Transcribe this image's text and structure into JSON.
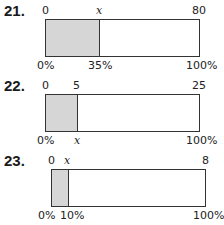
{
  "problems": [
    {
      "number": "21.",
      "top_labels": {
        "start": "0",
        "part": "x",
        "whole": "80"
      },
      "bottom_labels": {
        "start": "0%",
        "part": "35%",
        "whole": "100%"
      },
      "filled_fraction": 0.35,
      "fill_color": "#d6d6d6"
    },
    {
      "number": "22.",
      "top_labels": {
        "start": "0",
        "part": "5",
        "whole": "25"
      },
      "bottom_labels": {
        "start": "0%",
        "part": "x",
        "whole": "100%"
      },
      "filled_fraction": 0.2,
      "fill_color": "#d6d6d6"
    },
    {
      "number": "23.",
      "top_labels": {
        "start": "0",
        "part": "x",
        "whole": "8"
      },
      "bottom_labels": {
        "start": "0%",
        "part": "10%",
        "whole": "100%"
      },
      "filled_fraction": 0.1,
      "fill_color": "#d6d6d6"
    }
  ]
}
